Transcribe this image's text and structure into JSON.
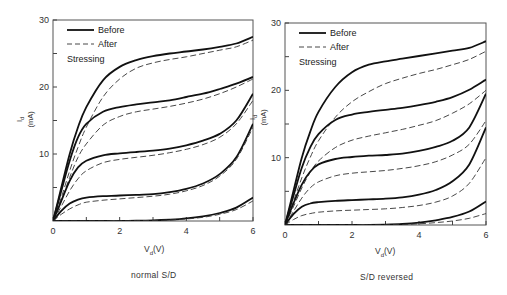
{
  "chart_data": [
    {
      "type": "line",
      "panel": "left",
      "title": "",
      "caption": "normal S/D",
      "xlabel": "Vd(V)",
      "xlabel_main": "V",
      "xlabel_sub": "d",
      "xlabel_unit": "(V)",
      "ylabel": "Id (mA)",
      "ylabel_main": "I",
      "ylabel_sub": "d",
      "ylabel_unit": "(mA)",
      "xlim": [
        0,
        6
      ],
      "ylim": [
        0,
        30
      ],
      "xticks": [
        0,
        2,
        4,
        6
      ],
      "xticks_minor": [
        1,
        3,
        5
      ],
      "yticks": [
        10,
        20,
        30
      ],
      "yticks_labels": [
        "10",
        "20",
        "30"
      ],
      "yticks_minor": [
        5,
        15,
        25
      ],
      "legend": {
        "before": "Before",
        "after": "After",
        "note": "Stressing",
        "position": "upper-left"
      },
      "grid": false,
      "x": [
        0,
        0.25,
        0.5,
        0.75,
        1,
        1.5,
        2,
        2.5,
        3,
        3.5,
        4,
        4.5,
        5,
        5.5,
        6
      ],
      "series": [
        {
          "name": "Before",
          "style": "solid",
          "curve": 1,
          "values": [
            0,
            5,
            10,
            14,
            17,
            21,
            23,
            24,
            24.6,
            25,
            25.3,
            25.6,
            26,
            26.5,
            27.5
          ]
        },
        {
          "name": "After",
          "style": "dashed",
          "curve": 1,
          "values": [
            0,
            3.5,
            7.5,
            11,
            14,
            18.5,
            21.2,
            22.8,
            23.6,
            24.1,
            24.5,
            25,
            25.5,
            26,
            27
          ]
        },
        {
          "name": "Before",
          "style": "solid",
          "curve": 2,
          "values": [
            0,
            4.5,
            9,
            12.5,
            14.5,
            16.3,
            17,
            17.4,
            17.7,
            18,
            18.5,
            19,
            19.7,
            20.5,
            21.5
          ]
        },
        {
          "name": "After",
          "style": "dashed",
          "curve": 2,
          "values": [
            0,
            3,
            6.5,
            9.5,
            11.5,
            14.3,
            15.6,
            16.3,
            16.7,
            17.1,
            17.6,
            18.2,
            19,
            20,
            21.2
          ]
        },
        {
          "name": "Before",
          "style": "solid",
          "curve": 3,
          "values": [
            0,
            3,
            6,
            8,
            9,
            9.8,
            10.1,
            10.3,
            10.5,
            10.8,
            11.3,
            12,
            13,
            15,
            19
          ]
        },
        {
          "name": "After",
          "style": "dashed",
          "curve": 3,
          "values": [
            0,
            2.2,
            4.5,
            6.3,
            7.5,
            8.7,
            9.2,
            9.5,
            9.8,
            10.2,
            10.7,
            11.4,
            12.5,
            14.5,
            18
          ]
        },
        {
          "name": "Before",
          "style": "solid",
          "curve": 4,
          "values": [
            0,
            1.5,
            2.6,
            3.2,
            3.5,
            3.7,
            3.8,
            3.9,
            4,
            4.3,
            4.8,
            5.6,
            7,
            9.5,
            14.5
          ]
        },
        {
          "name": "After",
          "style": "dashed",
          "curve": 4,
          "values": [
            0,
            1,
            1.8,
            2.4,
            2.8,
            3.1,
            3.3,
            3.5,
            3.7,
            4,
            4.5,
            5.3,
            6.7,
            9.2,
            14
          ]
        },
        {
          "name": "Before",
          "style": "solid",
          "curve": 5,
          "values": [
            0,
            0,
            0,
            0,
            0,
            0,
            0,
            0.05,
            0.1,
            0.2,
            0.4,
            0.7,
            1.2,
            2,
            3.5
          ]
        },
        {
          "name": "After",
          "style": "dashed",
          "curve": 5,
          "values": [
            0,
            0,
            0,
            0,
            0,
            0,
            0,
            0.04,
            0.08,
            0.15,
            0.3,
            0.55,
            1,
            1.7,
            3
          ]
        }
      ]
    },
    {
      "type": "line",
      "panel": "right",
      "title": "",
      "caption": "S/D reversed",
      "xlabel": "Vd(V)",
      "xlabel_main": "V",
      "xlabel_sub": "d",
      "xlabel_unit": "(V)",
      "ylabel": "Id (mA)",
      "ylabel_main": "I",
      "ylabel_sub": "d",
      "ylabel_unit": "(mA)",
      "xlim": [
        0,
        6
      ],
      "ylim": [
        0,
        30
      ],
      "xticks": [
        0,
        2,
        4,
        6
      ],
      "xticks_minor": [
        1,
        3,
        5
      ],
      "yticks": [
        10,
        20,
        30
      ],
      "yticks_labels": [
        "10",
        "20",
        "30"
      ],
      "yticks_minor": [
        5,
        15,
        25
      ],
      "legend": {
        "before": "Before",
        "after": "After",
        "note": "Stressing",
        "position": "upper-left"
      },
      "grid": false,
      "x": [
        0,
        0.25,
        0.5,
        0.75,
        1,
        1.5,
        2,
        2.5,
        3,
        3.5,
        4,
        4.5,
        5,
        5.5,
        6
      ],
      "series": [
        {
          "name": "Before",
          "style": "solid",
          "curve": 1,
          "values": [
            0,
            5,
            10,
            13.8,
            16.8,
            20.5,
            22.7,
            23.8,
            24.3,
            24.7,
            25.1,
            25.5,
            25.9,
            26.3,
            27.3
          ]
        },
        {
          "name": "After",
          "style": "dashed",
          "curve": 1,
          "values": [
            0,
            3.5,
            7,
            10,
            12.5,
            16,
            18.3,
            19.8,
            21,
            21.8,
            22.5,
            23.1,
            23.8,
            24.6,
            25.8
          ]
        },
        {
          "name": "Before",
          "style": "solid",
          "curve": 2,
          "values": [
            0,
            4.3,
            8.5,
            11.5,
            13.5,
            15.6,
            16.4,
            16.8,
            17.1,
            17.4,
            17.8,
            18.3,
            19,
            20.1,
            21.6
          ]
        },
        {
          "name": "After",
          "style": "dashed",
          "curve": 2,
          "values": [
            0,
            2.7,
            5.5,
            7.8,
            9.5,
            11.5,
            12.6,
            13.2,
            13.7,
            14.2,
            14.8,
            15.5,
            16.6,
            18,
            20
          ]
        },
        {
          "name": "Before",
          "style": "solid",
          "curve": 3,
          "values": [
            0,
            3.2,
            6,
            7.9,
            9,
            9.8,
            10.1,
            10.3,
            10.4,
            10.6,
            11,
            11.6,
            12.5,
            14.5,
            19.5
          ]
        },
        {
          "name": "After",
          "style": "dashed",
          "curve": 3,
          "values": [
            0,
            2,
            4,
            5.5,
            6.4,
            7.3,
            7.7,
            7.9,
            8.1,
            8.4,
            8.8,
            9.4,
            10.4,
            12,
            15.5
          ]
        },
        {
          "name": "Before",
          "style": "solid",
          "curve": 4,
          "values": [
            0,
            1.6,
            2.7,
            3.2,
            3.4,
            3.6,
            3.7,
            3.8,
            3.9,
            4.1,
            4.5,
            5.2,
            6.5,
            9,
            14.5
          ]
        },
        {
          "name": "After",
          "style": "dashed",
          "curve": 4,
          "values": [
            0,
            0.8,
            1.4,
            1.7,
            1.9,
            2.1,
            2.2,
            2.3,
            2.4,
            2.6,
            2.9,
            3.4,
            4.3,
            6.2,
            10
          ]
        },
        {
          "name": "Before",
          "style": "solid",
          "curve": 5,
          "values": [
            0,
            0,
            0,
            0,
            0,
            0,
            0,
            0,
            0.05,
            0.15,
            0.35,
            0.7,
            1.2,
            2,
            3.5
          ]
        },
        {
          "name": "After",
          "style": "dashed",
          "curve": 5,
          "values": [
            0,
            0,
            0,
            0,
            0,
            0,
            0,
            0,
            0.03,
            0.08,
            0.18,
            0.35,
            0.6,
            1,
            1.7
          ]
        }
      ]
    }
  ],
  "panels": {
    "left": {
      "caption": "normal S/D"
    },
    "right": {
      "caption": "S/D reversed"
    }
  }
}
